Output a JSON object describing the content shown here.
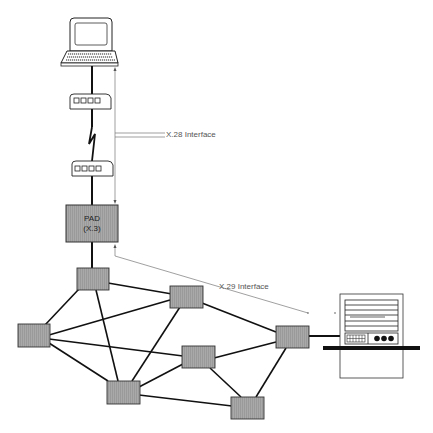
{
  "diagram": {
    "colors": {
      "background": "#ffffff",
      "line": "#111111",
      "node_fill": "#a8a8a8",
      "node_stroke": "#333333",
      "pad_fill": "#a3a3a3",
      "annotation_line": "#777777",
      "label_text": "#555555"
    },
    "terminal": {
      "icon": "laptop-terminal-icon"
    },
    "modems": [
      {
        "id": "modem-top",
        "icon": "modem-icon"
      },
      {
        "id": "modem-bottom",
        "icon": "modem-icon"
      }
    ],
    "link": {
      "icon": "lightning-link-icon"
    },
    "pad": {
      "line1": "PAD",
      "line2": "(X.3)"
    },
    "annotations": {
      "x28": "X.28 Interface",
      "x29": "X.29 Interface"
    },
    "network_nodes": [
      {
        "id": "n1"
      },
      {
        "id": "n2"
      },
      {
        "id": "n3"
      },
      {
        "id": "n4"
      },
      {
        "id": "n5"
      },
      {
        "id": "n6"
      },
      {
        "id": "n7"
      }
    ],
    "host": {
      "icon": "host-computer-icon"
    }
  }
}
